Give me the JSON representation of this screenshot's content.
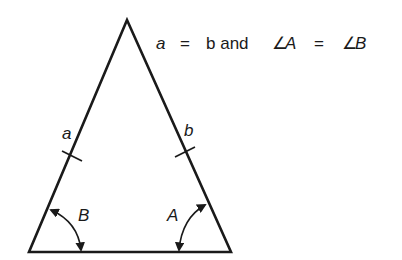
{
  "diagram": {
    "type": "isosceles-triangle",
    "caption": {
      "lhs": "a",
      "eq1": "=",
      "mid": "b and",
      "angle_sym_1": "∠",
      "angleA": "A",
      "eq2": "=",
      "angle_sym_2": "∠",
      "angleB": "B"
    },
    "side_labels": {
      "left": "a",
      "right": "b"
    },
    "angle_labels": {
      "left": "B",
      "right": "A"
    },
    "colors": {
      "stroke": "#1a1a1a",
      "background": "#ffffff"
    }
  }
}
